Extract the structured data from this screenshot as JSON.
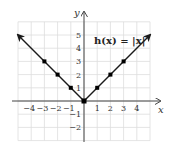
{
  "chart_data": {
    "type": "line",
    "title": "h(x) = |x|",
    "xlabel": "x",
    "ylabel": "y",
    "xlim": [
      -5,
      5
    ],
    "ylim": [
      -3,
      6
    ],
    "grid": true,
    "x_ticks": [
      -4,
      -3,
      -2,
      -1,
      1,
      2,
      3,
      4
    ],
    "y_ticks": [
      -2,
      -1,
      1,
      2,
      3,
      4,
      5
    ],
    "series": [
      {
        "name": "h(x) = |x|",
        "points": [
          {
            "x": -3,
            "y": 3
          },
          {
            "x": -2,
            "y": 2
          },
          {
            "x": -1,
            "y": 1
          },
          {
            "x": 0,
            "y": 0
          },
          {
            "x": 1,
            "y": 1
          },
          {
            "x": 2,
            "y": 2
          },
          {
            "x": 3,
            "y": 3
          }
        ],
        "arrow_ends": [
          {
            "x": -5,
            "y": 5
          },
          {
            "x": 5,
            "y": 5
          }
        ]
      }
    ],
    "annotations": [
      {
        "text": "h(x) = |x|",
        "x": 1.3,
        "y": 4.3
      }
    ]
  },
  "labels": {
    "x_axis": "x",
    "y_axis": "y",
    "function": "h(x) = |x|",
    "x_ticks": [
      "−4",
      "−3",
      "−2",
      "−1",
      "1",
      "2",
      "3",
      "4"
    ],
    "y_ticks": [
      "5",
      "4",
      "3",
      "2",
      "1",
      "−1",
      "−2"
    ]
  },
  "colors": {
    "grid": "#dddddd",
    "axis": "#444444",
    "line": "#1a1a1a",
    "point": "#000000"
  }
}
